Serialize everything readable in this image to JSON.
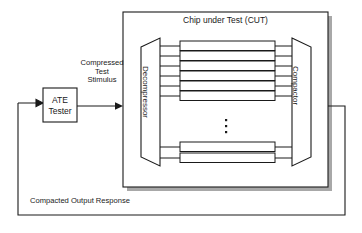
{
  "diagram": {
    "colors": {
      "line": "#1a1a1a",
      "shadow": "#a8a8a8",
      "chain_fill": "#ffffff",
      "background": "#ffffff"
    },
    "outer_loop": {
      "name": "feedback-loop-path",
      "description": "Compacted output response feedback loop from compactor back to ATE tester"
    },
    "blocks": {
      "ate_tester": {
        "label_line1": "ATE",
        "label_line2": "Tester",
        "shape": "rectangle"
      },
      "cut": {
        "title": "Chip under Test (CUT)",
        "shape": "rectangle-with-shadow"
      },
      "decompressor": {
        "label": "Decompressor",
        "shape": "trapezoid-expanding"
      },
      "compactor": {
        "label": "Compactor",
        "shape": "trapezoid-converging"
      }
    },
    "labels": {
      "compressed_test_stimulus": "Compressed\nTest\nStimulus",
      "compacted_output_response": "Compacted Output Response"
    },
    "scan_chains": {
      "top_group_count": 6,
      "bottom_group_count": 2,
      "ellipsis": "⋮",
      "description": "Parallel internal scan chains between decompressor and compactor"
    }
  }
}
